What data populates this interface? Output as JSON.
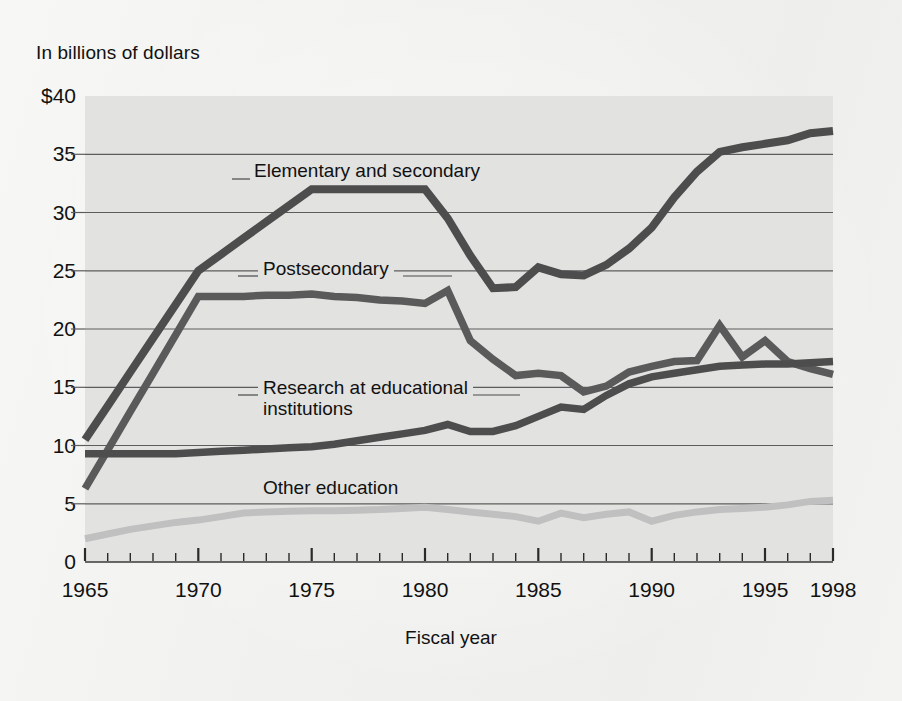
{
  "figure": {
    "unit_label": "In billions of dollars",
    "x_axis_title": "Fiscal year",
    "plot_background": "#e2e2e0",
    "page_background": "#f4f4f2"
  },
  "chart_data": {
    "type": "line",
    "title": "",
    "subtitle": "",
    "xlabel": "Fiscal year",
    "ylabel": "In billions of dollars",
    "ylim": [
      0,
      40
    ],
    "xlim": [
      1965,
      1998
    ],
    "grid": true,
    "gridlines_y": [
      5,
      10,
      15,
      20,
      25,
      30,
      35
    ],
    "legend_position": "inline-annotations",
    "ytick_labels": [
      "$40",
      "35",
      "30",
      "25",
      "20",
      "15",
      "10",
      "5",
      "0"
    ],
    "ytick_values": [
      40,
      35,
      30,
      25,
      20,
      15,
      10,
      5,
      0
    ],
    "xtick_labels": [
      "1965",
      "1970",
      "1975",
      "1980",
      "1985",
      "1990",
      "1995",
      "1998"
    ],
    "xtick_values": [
      1965,
      1970,
      1975,
      1980,
      1985,
      1990,
      1995,
      1998
    ],
    "x_minor_ticks": [
      1965,
      1966,
      1967,
      1968,
      1969,
      1970,
      1971,
      1972,
      1973,
      1974,
      1975,
      1976,
      1977,
      1978,
      1979,
      1980,
      1981,
      1982,
      1983,
      1984,
      1985,
      1986,
      1987,
      1988,
      1989,
      1990,
      1991,
      1992,
      1993,
      1994,
      1995,
      1996,
      1997,
      1998
    ],
    "x": [
      1965,
      1966,
      1967,
      1968,
      1969,
      1970,
      1971,
      1972,
      1973,
      1974,
      1975,
      1976,
      1977,
      1978,
      1979,
      1980,
      1981,
      1982,
      1983,
      1984,
      1985,
      1986,
      1987,
      1988,
      1989,
      1990,
      1991,
      1992,
      1993,
      1994,
      1995,
      1996,
      1997,
      1998
    ],
    "series": [
      {
        "name": "Elementary and secondary",
        "color": "#4d4d4d",
        "values": [
          10.5,
          13.4,
          16.3,
          19.2,
          22.1,
          25.0,
          26.4,
          27.8,
          29.2,
          30.6,
          32.0,
          32.0,
          32.0,
          32.0,
          32.0,
          32.0,
          29.5,
          26.3,
          23.5,
          23.6,
          25.3,
          24.7,
          24.6,
          25.5,
          26.9,
          28.7,
          31.3,
          33.5,
          35.2,
          35.6,
          35.9,
          36.2,
          36.8,
          37.0
        ]
      },
      {
        "name": "Postsecondary",
        "color": "#5a5a5a",
        "values": [
          6.3,
          9.6,
          12.9,
          16.2,
          19.5,
          22.8,
          22.8,
          22.8,
          22.9,
          22.9,
          23.0,
          22.8,
          22.7,
          22.5,
          22.4,
          22.2,
          23.3,
          19.0,
          17.4,
          16.0,
          16.2,
          16.0,
          14.6,
          15.1,
          16.3,
          16.8,
          17.2,
          17.3,
          20.3,
          17.6,
          19.0,
          17.2,
          16.6,
          16.1
        ]
      },
      {
        "name": "Research at educational\ninstitutions",
        "color": "#4d4d4d",
        "values": [
          9.3,
          9.3,
          9.3,
          9.3,
          9.3,
          9.4,
          9.5,
          9.6,
          9.7,
          9.8,
          9.9,
          10.1,
          10.4,
          10.7,
          11.0,
          11.3,
          11.8,
          11.2,
          11.2,
          11.7,
          12.5,
          13.3,
          13.1,
          14.3,
          15.3,
          15.9,
          16.2,
          16.5,
          16.8,
          16.9,
          17.0,
          17.0,
          17.1,
          17.2
        ]
      },
      {
        "name": "Other education",
        "color": "#c0c0c0",
        "values": [
          2.0,
          2.4,
          2.8,
          3.1,
          3.4,
          3.6,
          3.9,
          4.2,
          4.3,
          4.35,
          4.4,
          4.4,
          4.45,
          4.5,
          4.6,
          4.7,
          4.5,
          4.3,
          4.1,
          3.9,
          3.5,
          4.2,
          3.8,
          4.1,
          4.3,
          3.5,
          4.0,
          4.3,
          4.5,
          4.6,
          4.7,
          4.9,
          5.2,
          5.3
        ]
      }
    ],
    "annotations": [
      {
        "text": "Elementary and secondary",
        "series": "Elementary and secondary"
      },
      {
        "text": "Postsecondary",
        "series": "Postsecondary"
      },
      {
        "text": "Research at educational institutions",
        "series": "Research at educational institutions"
      },
      {
        "text": "Other education",
        "series": "Other education"
      }
    ]
  }
}
